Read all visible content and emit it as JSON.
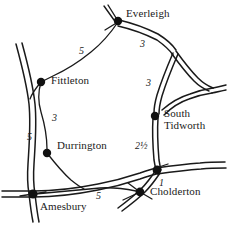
{
  "map": {
    "title": "Road map of Wiltshire villages",
    "style": "hand-drawn line map",
    "background_color": "#ffffff",
    "ink_color": "#1a1a1a",
    "places": [
      {
        "name": "Everleigh",
        "label": "Everleigh",
        "x": 118,
        "y": 21,
        "label_x": 126,
        "label_y": 8,
        "node": true
      },
      {
        "name": "Fittleton",
        "label": "Fittleton",
        "x": 41,
        "y": 82,
        "label_x": 51,
        "label_y": 75,
        "node": true
      },
      {
        "name": "South Tidworth",
        "label": "South\nTidworth",
        "x": 155,
        "y": 116,
        "label_x": 164,
        "label_y": 108,
        "node": true
      },
      {
        "name": "Durrington",
        "label": "Durrington",
        "x": 47,
        "y": 153,
        "label_x": 57,
        "label_y": 140,
        "node": true
      },
      {
        "name": "Amesbury",
        "label": "Amesbury",
        "x": 33,
        "y": 194,
        "label_x": 40,
        "label_y": 201,
        "node": true
      },
      {
        "name": "Cholderton",
        "label": "Cholderton",
        "x": 140,
        "y": 192,
        "label_x": 150,
        "label_y": 186,
        "node": true
      }
    ],
    "distances": [
      {
        "id": "everleigh-fittleton",
        "value": "5",
        "x": 79,
        "y": 45
      },
      {
        "id": "everleigh-junction",
        "value": "3",
        "x": 140,
        "y": 38
      },
      {
        "id": "junction-south-tidworth",
        "value": "3",
        "x": 146,
        "y": 77
      },
      {
        "id": "fittleton-durrington",
        "value": "3",
        "x": 52,
        "y": 112
      },
      {
        "id": "amesbury-durrington-main",
        "value": "5",
        "x": 27,
        "y": 131
      },
      {
        "id": "south-tidworth-cholderton",
        "value": "2½",
        "x": 135,
        "y": 140
      },
      {
        "id": "junction-cholderton",
        "value": "1",
        "x": 159,
        "y": 177
      },
      {
        "id": "amesbury-cholderton",
        "value": "5",
        "x": 96,
        "y": 190
      }
    ],
    "roads": [
      {
        "id": "main-road-west",
        "type": "double",
        "desc": "main road running north-south through Amesbury"
      },
      {
        "id": "main-road-south",
        "type": "double",
        "desc": "main road Amesbury to Cholderton junction"
      },
      {
        "id": "everleigh-east",
        "type": "double",
        "desc": "Everleigh east to triangular junction"
      },
      {
        "id": "tidworth-spur",
        "type": "double",
        "desc": "South Tidworth north to triangular junction"
      },
      {
        "id": "tidworth-south",
        "type": "double",
        "desc": "South Tidworth south to Cholderton junction"
      },
      {
        "id": "everleigh-fittleton",
        "type": "single",
        "desc": "Everleigh west to Fittleton"
      },
      {
        "id": "fittleton-durrington",
        "type": "single",
        "desc": "Fittleton south to Durrington"
      },
      {
        "id": "durrington-south",
        "type": "single",
        "desc": "Durrington south to main road"
      },
      {
        "id": "triangle-loop",
        "type": "double",
        "desc": "triangular road loop east of map"
      }
    ]
  }
}
